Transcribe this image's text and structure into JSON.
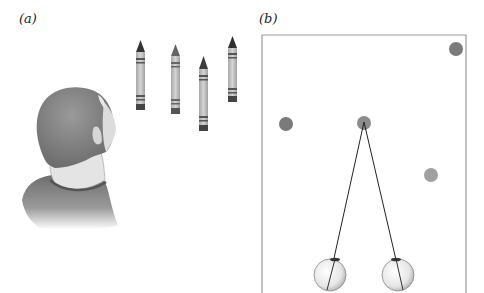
{
  "panels": [
    {
      "id": "a",
      "label": "(a)",
      "description": "Person viewed from behind looking at four crayons standing upright"
    },
    {
      "id": "b",
      "label": "(b)",
      "description": "Top-down schematic: four dots in a frame, two eyes converging on the central dot"
    }
  ],
  "panel_a": {
    "crayons": [
      {
        "x": 136,
        "top": 40,
        "bottom": 110,
        "tip_color": "#3a3a3a"
      },
      {
        "x": 171,
        "top": 44,
        "bottom": 114,
        "tip_color": "#6a6a6a"
      },
      {
        "x": 199,
        "top": 56,
        "bottom": 131,
        "tip_color": "#444444"
      },
      {
        "x": 228,
        "top": 36,
        "bottom": 102,
        "tip_color": "#333333"
      }
    ]
  },
  "panel_b": {
    "frame": {
      "x": 262,
      "y": 35,
      "width": 204,
      "color": "#9a9a9a"
    },
    "dots": [
      {
        "cx": 456,
        "cy": 49,
        "r": 7,
        "color": "#7a7a7a"
      },
      {
        "cx": 286,
        "cy": 124,
        "r": 7,
        "color": "#7a7a7a"
      },
      {
        "cx": 364,
        "cy": 123,
        "r": 7,
        "color": "#8c8c8c",
        "fixated": true
      },
      {
        "cx": 431,
        "cy": 175,
        "r": 7,
        "color": "#a0a0a0"
      }
    ],
    "eyes": [
      {
        "cx": 330,
        "cy": 275,
        "r": 16
      },
      {
        "cx": 398,
        "cy": 275,
        "r": 16
      }
    ]
  }
}
